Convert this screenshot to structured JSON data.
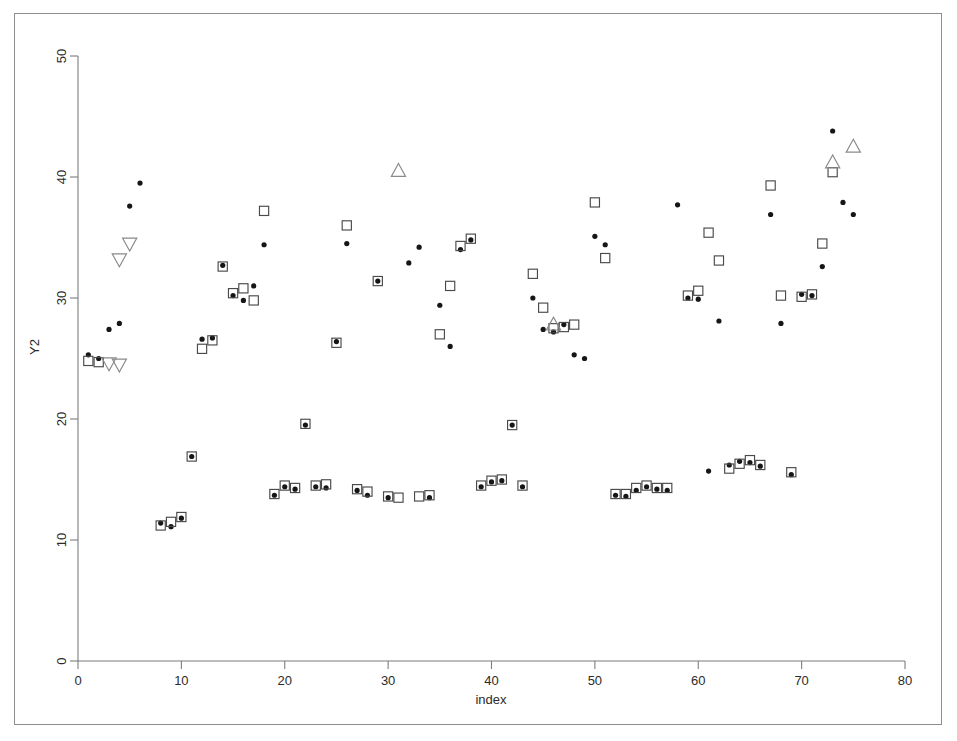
{
  "figure": {
    "background_color": "#ffffff",
    "border_color": "#8d8d8d",
    "axis_color": "#7d7d7d"
  },
  "axes": {
    "x_title": "index",
    "y_title": "Y2",
    "x_ticks": [
      "0",
      "10",
      "20",
      "30",
      "40",
      "50",
      "60",
      "70",
      "80"
    ],
    "y_ticks": [
      "0",
      "10",
      "20",
      "30",
      "40",
      "50"
    ]
  },
  "chart_data": {
    "type": "scatter",
    "title": "",
    "xlabel": "index",
    "ylabel": "Y2",
    "xlim": [
      0,
      80
    ],
    "ylim": [
      0,
      50
    ],
    "xticks": [
      0,
      10,
      20,
      30,
      40,
      50,
      60,
      70,
      80
    ],
    "yticks": [
      0,
      10,
      20,
      30,
      40,
      50
    ],
    "grid": false,
    "legend": "none",
    "marker_colors": {
      "dot": "#161616",
      "square": "#4a4a4a",
      "triangle_up": "#8a8a8a",
      "triangle_down": "#8a8a8a"
    },
    "series": [
      {
        "name": "dot",
        "marker": "filled-circle",
        "points": [
          [
            1,
            25.3
          ],
          [
            2,
            25.0
          ],
          [
            3,
            27.4
          ],
          [
            4,
            27.9
          ],
          [
            5,
            37.6
          ],
          [
            6,
            39.5
          ],
          [
            8,
            11.4
          ],
          [
            9,
            11.1
          ],
          [
            10,
            11.8
          ],
          [
            11,
            16.9
          ],
          [
            12,
            26.6
          ],
          [
            13,
            26.7
          ],
          [
            14,
            32.7
          ],
          [
            15,
            30.2
          ],
          [
            16,
            29.8
          ],
          [
            17,
            31.0
          ],
          [
            18,
            34.4
          ],
          [
            19,
            13.7
          ],
          [
            20,
            14.4
          ],
          [
            21,
            14.2
          ],
          [
            22,
            19.5
          ],
          [
            23,
            14.4
          ],
          [
            24,
            14.3
          ],
          [
            25,
            26.4
          ],
          [
            26,
            34.5
          ],
          [
            27,
            14.1
          ],
          [
            28,
            13.7
          ],
          [
            29,
            31.4
          ],
          [
            30,
            13.5
          ],
          [
            32,
            32.9
          ],
          [
            33,
            34.2
          ],
          [
            34,
            13.5
          ],
          [
            35,
            29.4
          ],
          [
            36,
            26.0
          ],
          [
            37,
            34.0
          ],
          [
            38,
            34.8
          ],
          [
            39,
            14.4
          ],
          [
            40,
            14.8
          ],
          [
            41,
            14.9
          ],
          [
            42,
            19.5
          ],
          [
            43,
            14.4
          ],
          [
            44,
            30.0
          ],
          [
            45,
            27.4
          ],
          [
            46,
            27.2
          ],
          [
            47,
            27.8
          ],
          [
            48,
            25.3
          ],
          [
            49,
            25.0
          ],
          [
            50,
            35.1
          ],
          [
            51,
            34.4
          ],
          [
            52,
            13.7
          ],
          [
            53,
            13.6
          ],
          [
            54,
            14.1
          ],
          [
            55,
            14.4
          ],
          [
            56,
            14.2
          ],
          [
            57,
            14.1
          ],
          [
            58,
            37.7
          ],
          [
            59,
            30.0
          ],
          [
            60,
            29.9
          ],
          [
            61,
            15.7
          ],
          [
            62,
            28.1
          ],
          [
            63,
            16.2
          ],
          [
            64,
            16.5
          ],
          [
            65,
            16.4
          ],
          [
            66,
            16.1
          ],
          [
            67,
            36.9
          ],
          [
            68,
            27.9
          ],
          [
            69,
            15.4
          ],
          [
            70,
            30.3
          ],
          [
            71,
            30.2
          ],
          [
            72,
            32.6
          ],
          [
            73,
            43.8
          ],
          [
            74,
            37.9
          ],
          [
            75,
            36.9
          ]
        ]
      },
      {
        "name": "square",
        "marker": "open-square",
        "points": [
          [
            1,
            24.8
          ],
          [
            2,
            24.7
          ],
          [
            8,
            11.2
          ],
          [
            9,
            11.5
          ],
          [
            10,
            11.9
          ],
          [
            11,
            16.9
          ],
          [
            12,
            25.8
          ],
          [
            13,
            26.5
          ],
          [
            14,
            32.6
          ],
          [
            15,
            30.4
          ],
          [
            16,
            30.8
          ],
          [
            17,
            29.8
          ],
          [
            18,
            37.2
          ],
          [
            19,
            13.8
          ],
          [
            20,
            14.5
          ],
          [
            21,
            14.3
          ],
          [
            22,
            19.6
          ],
          [
            23,
            14.5
          ],
          [
            24,
            14.6
          ],
          [
            25,
            26.3
          ],
          [
            26,
            36.0
          ],
          [
            27,
            14.2
          ],
          [
            28,
            14.0
          ],
          [
            29,
            31.4
          ],
          [
            30,
            13.6
          ],
          [
            31,
            13.5
          ],
          [
            33,
            13.6
          ],
          [
            34,
            13.7
          ],
          [
            35,
            27.0
          ],
          [
            36,
            31.0
          ],
          [
            37,
            34.3
          ],
          [
            38,
            34.9
          ],
          [
            39,
            14.5
          ],
          [
            40,
            14.9
          ],
          [
            41,
            15.0
          ],
          [
            42,
            19.5
          ],
          [
            43,
            14.5
          ],
          [
            44,
            32.0
          ],
          [
            45,
            29.2
          ],
          [
            46,
            27.5
          ],
          [
            47,
            27.6
          ],
          [
            48,
            27.8
          ],
          [
            50,
            37.9
          ],
          [
            51,
            33.3
          ],
          [
            52,
            13.8
          ],
          [
            53,
            13.8
          ],
          [
            54,
            14.3
          ],
          [
            55,
            14.5
          ],
          [
            56,
            14.3
          ],
          [
            57,
            14.3
          ],
          [
            59,
            30.2
          ],
          [
            60,
            30.6
          ],
          [
            61,
            35.4
          ],
          [
            62,
            33.1
          ],
          [
            63,
            15.9
          ],
          [
            64,
            16.3
          ],
          [
            65,
            16.6
          ],
          [
            66,
            16.2
          ],
          [
            67,
            39.3
          ],
          [
            68,
            30.2
          ],
          [
            69,
            15.6
          ],
          [
            70,
            30.1
          ],
          [
            71,
            30.3
          ],
          [
            72,
            34.5
          ],
          [
            73,
            40.4
          ]
        ]
      },
      {
        "name": "triangle_up",
        "marker": "open-triangle-up",
        "points": [
          [
            31,
            40.5
          ],
          [
            46,
            27.8
          ],
          [
            73,
            41.2
          ],
          [
            75,
            42.5
          ]
        ]
      },
      {
        "name": "triangle_down",
        "marker": "open-triangle-down",
        "points": [
          [
            3,
            24.6
          ],
          [
            4,
            24.5
          ],
          [
            4,
            33.2
          ],
          [
            5,
            34.5
          ]
        ]
      }
    ]
  }
}
